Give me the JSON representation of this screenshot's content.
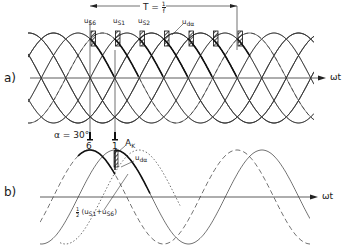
{
  "figure": {
    "part_a": {
      "label": "a)",
      "axis_label": "ωt",
      "period_label": "T = 1/f",
      "period_label_T": "T =",
      "period_frac_num": "1",
      "period_frac_den": "f",
      "phase_labels": [
        {
          "base": "u",
          "sub": "S6"
        },
        {
          "base": "u",
          "sub": "S1"
        },
        {
          "base": "u",
          "sub": "S2"
        }
      ],
      "output_voltage_label": {
        "base": "u",
        "sub": "dα"
      }
    },
    "part_b": {
      "label": "b)",
      "axis_label": "ωt",
      "firing_angle_label": "α = 30°",
      "thyristor_labels": [
        "6",
        "1"
      ],
      "commutation_area_label": {
        "base": "A",
        "sub": "K"
      },
      "output_voltage_label": {
        "base": "u",
        "sub": "dα"
      },
      "mean_label_num": "1",
      "mean_label_den": "2",
      "mean_label_expr": "(u",
      "mean_label_sub1": "S1",
      "mean_label_plus": "+u",
      "mean_label_sub2": "S6",
      "mean_label_close": ")"
    },
    "colors": {
      "line": "#333333",
      "bold": "#111111",
      "background": "#ffffff"
    }
  }
}
